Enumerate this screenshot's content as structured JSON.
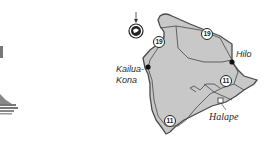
{
  "map": {
    "region": "Island of Hawaii",
    "colors": {
      "land": "#c8c8c8",
      "outline": "#4a4a4a",
      "road": "#555555",
      "background": "#ffffff"
    },
    "places": [
      {
        "name": "Kailua-Kona",
        "line1": "Kailua-",
        "line2": "Kona",
        "type": "city"
      },
      {
        "name": "Hilo",
        "type": "city"
      },
      {
        "name": "Halape",
        "type": "site"
      }
    ],
    "routes": [
      {
        "number": "19",
        "position": "northwest"
      },
      {
        "number": "19",
        "position": "northeast"
      },
      {
        "number": "11",
        "position": "east"
      },
      {
        "number": "11",
        "position": "south"
      }
    ],
    "compass": {
      "icon": "north-arrow-compass-icon"
    },
    "left_graphic": {
      "icon": "partial-decorative-graphic"
    }
  }
}
